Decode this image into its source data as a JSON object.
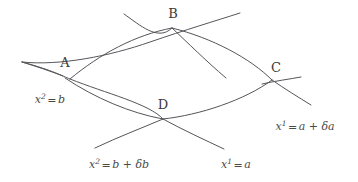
{
  "figure": {
    "type": "geometry-diagram",
    "background_color": "#ffffff",
    "line_color": "#55555a",
    "text_color": "#3f3f3f"
  },
  "vertices": [
    {
      "id": "A",
      "label": "A",
      "x": 65,
      "y": 78,
      "label_x": 65,
      "label_y": 62
    },
    {
      "id": "B",
      "label": "B",
      "x": 172,
      "y": 28,
      "label_x": 173,
      "label_y": 13
    },
    {
      "id": "C",
      "label": "C",
      "x": 272,
      "y": 80,
      "label_x": 276,
      "label_y": 67
    },
    {
      "id": "D",
      "label": "D",
      "x": 163,
      "y": 119,
      "label_x": 163,
      "label_y": 104
    }
  ],
  "equations": [
    {
      "id": "x2-eq-b",
      "base": "x",
      "superscript": "2",
      "operator": "=",
      "rhs": "b",
      "full_text": "x² = b",
      "x": 50,
      "y": 99
    },
    {
      "id": "x2-eq-b-plus-delta-b",
      "base": "x",
      "superscript": "2",
      "operator": "=",
      "rhs": "b + δb",
      "full_text": "x² = b + δb",
      "x": 119,
      "y": 164
    },
    {
      "id": "x1-eq-a",
      "base": "x",
      "superscript": "1",
      "operator": "=",
      "rhs": "a",
      "full_text": "x¹ = a",
      "x": 236,
      "y": 164
    },
    {
      "id": "x1-eq-a-plus-delta-a",
      "base": "x",
      "superscript": "1",
      "operator": "=",
      "rhs": "a + δa",
      "full_text": "x¹ = a + δa",
      "x": 305,
      "y": 126
    }
  ],
  "curves": [
    {
      "id": "curve-x2-eq-b",
      "name": "x2-equals-b-curve",
      "path": "M 22,62 Q 100,48 172,28 T 242,12",
      "note": "upper-left coordinate curve through A and B"
    },
    {
      "id": "curve-x2-eq-b-plus-db",
      "name": "x2-equals-b-plus-delta-b-curve",
      "path": "M 95,148 Q 130,133 163,119 T 310,62",
      "note": "lower coordinate curve through D and C"
    },
    {
      "id": "curve-x1-eq-a",
      "name": "x1-equals-a-curve",
      "path": "M 124,14 Q 142,46 163,119 T 226,149",
      "note": "left-to-bottom coordinate curve through B and D"
    },
    {
      "id": "curve-x1-eq-a-plus-da",
      "name": "x1-equals-a-plus-delta-a-curve",
      "path": "M 22,62 Q 140,92 272,80 T 312,104",
      "note": "curve through A and C"
    }
  ]
}
